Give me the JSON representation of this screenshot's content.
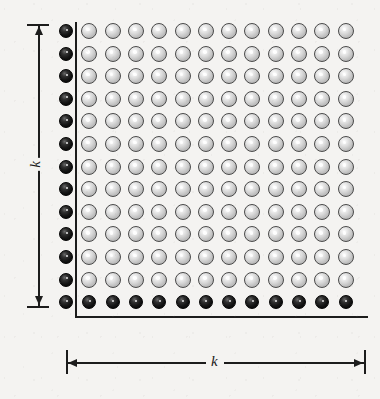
{
  "figure": {
    "type": "lattice-grid-diagram",
    "background_color": "#f4f3f1",
    "ink_color": "#1c1c1c"
  },
  "labels": {
    "vertical_dimension": "k",
    "horizontal_dimension": "k"
  },
  "grid": {
    "interior_rows": 12,
    "interior_cols": 12,
    "border_left_count": 13,
    "border_bottom_count": 13,
    "origin_x": 66,
    "origin_y": 31,
    "step_x": 23.3,
    "step_y": 22.6,
    "interior_start_col": 1,
    "dot_diameter_gray": 16,
    "dot_diameter_black": 14,
    "gray_fill": "#d8d8d8",
    "gray_stroke": "#4a4a4a",
    "black_fill": "#000000"
  },
  "axes": {
    "vertical": {
      "x": 75,
      "y_top": 22,
      "y_bottom": 317
    },
    "horizontal": {
      "y": 316,
      "x_left": 75,
      "x_right": 368
    }
  },
  "dimension_vertical": {
    "x": 38,
    "y_top": 24,
    "y_bottom": 306,
    "tick_half_width": 11,
    "label": "k"
  },
  "dimension_horizontal": {
    "y": 362,
    "x_left": 66,
    "x_right": 364,
    "tick_half_height": 12,
    "label": "k"
  }
}
